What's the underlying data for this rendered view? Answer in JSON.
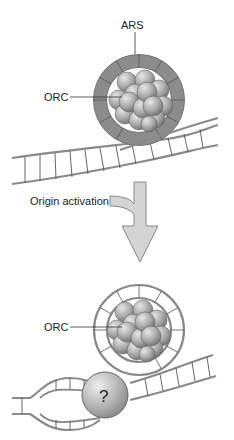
{
  "diagram": {
    "top_panel": {
      "labels": {
        "ars": "ARS",
        "orc": "ORC"
      }
    },
    "transition": {
      "label": "Origin activation"
    },
    "bottom_panel": {
      "labels": {
        "orc": "ORC",
        "unknown_factor": "?"
      }
    },
    "colors": {
      "ring_fill": "#8c8c8c",
      "ring_stroke": "#7a7a7a",
      "dna_stroke": "#8a8a8a",
      "arrow_fill": "#d4d4d4",
      "sphere_light": "#d9d9d9",
      "sphere_dark": "#7d7d7d"
    }
  }
}
